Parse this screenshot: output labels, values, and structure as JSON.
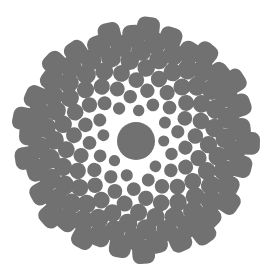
{
  "diagram": {
    "type": "phyllotaxis-spiral",
    "canvas": {
      "width": 270,
      "height": 280,
      "background": "#ffffff"
    },
    "center": {
      "x": 136,
      "y": 141
    },
    "center_disk_radius": 19,
    "dot_color": "#717171",
    "dot_count": 150,
    "golden_angle_deg": 137.508,
    "inner_radius": 27,
    "outer_radius": 114,
    "min_dot_radius": 5.5,
    "max_dot_radius": 11.5,
    "outer_tile_corner_squareness": 0.35
  }
}
